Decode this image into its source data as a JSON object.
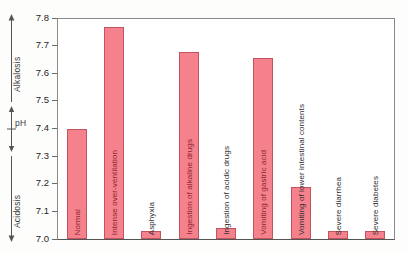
{
  "chart_data": {
    "type": "bar",
    "title": "",
    "subtitle": "",
    "xlabel": "",
    "ylabel": "pH",
    "ylim": [
      7.0,
      7.8
    ],
    "ytick_labels": [
      "7.8",
      "7.7",
      "7.6",
      "7.5",
      "7.4",
      "7.3",
      "7.2",
      "7.1",
      "7.0"
    ],
    "ytick_values": [
      7.8,
      7.7,
      7.6,
      7.5,
      7.4,
      7.3,
      7.2,
      7.1,
      7.0
    ],
    "grid": false,
    "legend": "none",
    "categories": [
      "Normal",
      "Intense over-ventilation",
      "Asphyxia",
      "Ingestion of alkaline drugs",
      "Ingestion of acidic drugs",
      "Vomiting of gastric acid",
      "Vomiting of lower intestinal contents",
      "Severe diarrhea",
      "Severe diabetes"
    ],
    "values": [
      7.4,
      7.77,
      7.03,
      7.68,
      7.04,
      7.66,
      7.19,
      7.03,
      7.03
    ],
    "bar_color": "#f4818c",
    "bar_edge_color": "#c2545f"
  },
  "annotations": {
    "alkalosis": "Alkalosis",
    "ph": "pH",
    "acidosis": "Acidosis"
  }
}
